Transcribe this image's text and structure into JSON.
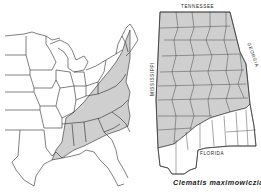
{
  "map": {
    "type": "species range map",
    "caption": "Clematis maximowicziana",
    "left_panel": {
      "region": "Eastern United States",
      "shaded_range": "Appalachian region from New England south to Gulf Coast",
      "shade_color": "#cfcfcf"
    },
    "right_panel": {
      "region": "Alabama counties",
      "shaded_range": "Northern and central Alabama counties",
      "shade_color": "#cfcfcf",
      "border_labels": {
        "north": "TENNESSEE",
        "east": "GEORGIA",
        "west": "MISSISSIPPI",
        "south": "FLORIDA"
      }
    }
  }
}
